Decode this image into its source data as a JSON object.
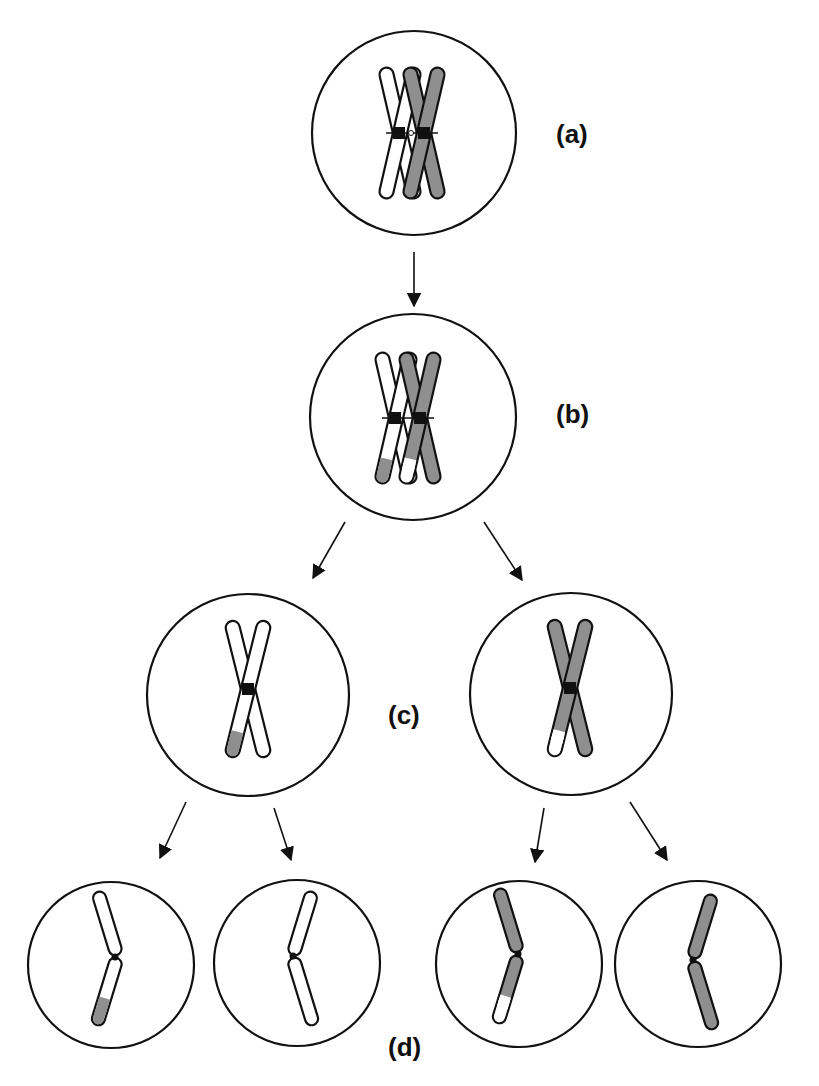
{
  "figure": {
    "stages": [
      {
        "id": "a",
        "label": "(a)",
        "description": "Homologous chromosome pair (white and gray), each duplicated into sister chromatids"
      },
      {
        "id": "b",
        "label": "(b)",
        "description": "Crossing over: tips exchanged between non-sister chromatids"
      },
      {
        "id": "c",
        "label": "(c)",
        "description": "Meiosis I products: two cells each with one recombinant chromosome"
      },
      {
        "id": "d",
        "label": "(d)",
        "description": "Meiosis II products: four haploid cells, two recombinant and two parental"
      }
    ],
    "colors": {
      "white_chromosome": "#ffffff",
      "gray_chromosome": "#8f8f8f",
      "outline": "#111111",
      "centromere": "#111111"
    }
  }
}
